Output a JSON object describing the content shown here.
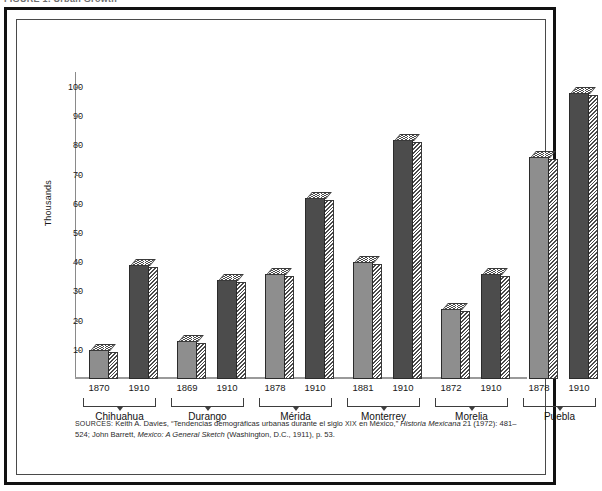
{
  "page": {
    "clipped_caption": "FIGURE 1.  Urban Growth"
  },
  "chart_data": {
    "type": "bar",
    "title": "",
    "xlabel": "",
    "ylabel": "Thousands",
    "ylim": [
      0,
      100
    ],
    "yticks": [
      10,
      20,
      30,
      40,
      50,
      60,
      70,
      80,
      90,
      100
    ],
    "grid": false,
    "legend": "none",
    "categories": [
      "Chihuahua",
      "Durango",
      "Mérida",
      "Monterrey",
      "Morelia",
      "Puebla"
    ],
    "series": [
      {
        "name": "Earliest census",
        "values": [
          10,
          13,
          36,
          40,
          24,
          76
        ]
      },
      {
        "name": "1910",
        "values": [
          39,
          34,
          62,
          82,
          36,
          98
        ]
      }
    ],
    "bars": [
      {
        "group": "Chihuahua",
        "year": "1870",
        "value": 10,
        "shade": "light"
      },
      {
        "group": "Chihuahua",
        "year": "1910",
        "value": 39,
        "shade": "dark"
      },
      {
        "group": "Durango",
        "year": "1869",
        "value": 13,
        "shade": "light"
      },
      {
        "group": "Durango",
        "year": "1910",
        "value": 34,
        "shade": "dark"
      },
      {
        "group": "Mérida",
        "year": "1878",
        "value": 36,
        "shade": "light"
      },
      {
        "group": "Mérida",
        "year": "1910",
        "value": 62,
        "shade": "dark"
      },
      {
        "group": "Monterrey",
        "year": "1881",
        "value": 40,
        "shade": "light"
      },
      {
        "group": "Monterrey",
        "year": "1910",
        "value": 82,
        "shade": "dark"
      },
      {
        "group": "Morelia",
        "year": "1872",
        "value": 24,
        "shade": "light"
      },
      {
        "group": "Morelia",
        "year": "1910",
        "value": 36,
        "shade": "dark"
      },
      {
        "group": "Puebla",
        "year": "1878",
        "value": 76,
        "shade": "light"
      },
      {
        "group": "Puebla",
        "year": "1910",
        "value": 98,
        "shade": "dark"
      }
    ],
    "colors": {
      "bar_light": "#8e8e8e",
      "bar_dark": "#4c4c4c",
      "outline": "#2b2b2b",
      "axis": "#8a8a8a",
      "frame": "#111111",
      "background": "#ffffff"
    }
  },
  "yticks": [
    {
      "label": "100"
    },
    {
      "label": "90"
    },
    {
      "label": "80"
    },
    {
      "label": "70"
    },
    {
      "label": "60"
    },
    {
      "label": "50"
    },
    {
      "label": "40"
    },
    {
      "label": "30"
    },
    {
      "label": "20"
    },
    {
      "label": "10"
    }
  ],
  "groups": [
    {
      "name": "Chihuahua",
      "years": [
        "1870",
        "1910"
      ]
    },
    {
      "name": "Durango",
      "years": [
        "1869",
        "1910"
      ]
    },
    {
      "name": "Mérida",
      "years": [
        "1878",
        "1910"
      ]
    },
    {
      "name": "Monterrey",
      "years": [
        "1881",
        "1910"
      ]
    },
    {
      "name": "Morelia",
      "years": [
        "1872",
        "1910"
      ]
    },
    {
      "name": "Puebla",
      "years": [
        "1878",
        "1910"
      ]
    }
  ],
  "source": {
    "prefix": "SOURCES:",
    "line1_a": " Keith A. Davies, “Tendencias demográficas urbanas durante el siglo",
    "line1_smallcaps": "XIX",
    "line1_b": "en México,”",
    "line1_italic": "Historia",
    "line2_italic1": "Mexicana",
    "line2_a": " 21 (1972): 481–524; John Barrett,",
    "line2_italic2": "Mexico: A General Sketch",
    "line2_b": " (Washington, D.C., 1911), p. 53."
  }
}
